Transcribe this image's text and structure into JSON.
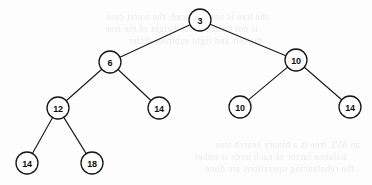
{
  "figure": {
    "kind": "binary-tree-diagram",
    "background_color": "#fdfdfd",
    "stroke_color": "#151515",
    "node_fill_color": "#ffffff",
    "node_radius": 11,
    "width": 372,
    "height": 185
  },
  "tree": {
    "nodes": [
      {
        "id": "n0",
        "label": "3",
        "x": 200,
        "y": 20,
        "level": 0
      },
      {
        "id": "n1",
        "label": "6",
        "x": 110,
        "y": 62,
        "level": 1
      },
      {
        "id": "n2",
        "label": "10",
        "x": 296,
        "y": 60,
        "level": 1
      },
      {
        "id": "n3",
        "label": "12",
        "x": 58,
        "y": 108,
        "level": 2
      },
      {
        "id": "n4",
        "label": "14",
        "x": 159,
        "y": 108,
        "level": 2
      },
      {
        "id": "n5",
        "label": "10",
        "x": 240,
        "y": 107,
        "level": 2
      },
      {
        "id": "n6",
        "label": "14",
        "x": 350,
        "y": 107,
        "level": 2
      },
      {
        "id": "n7",
        "label": "14",
        "x": 27,
        "y": 163,
        "level": 3
      },
      {
        "id": "n8",
        "label": "18",
        "x": 92,
        "y": 163,
        "level": 3
      }
    ],
    "edges": [
      {
        "from": "n0",
        "to": "n1"
      },
      {
        "from": "n0",
        "to": "n2"
      },
      {
        "from": "n1",
        "to": "n3"
      },
      {
        "from": "n1",
        "to": "n4"
      },
      {
        "from": "n2",
        "to": "n5"
      },
      {
        "from": "n2",
        "to": "n6"
      },
      {
        "from": "n3",
        "to": "n7"
      },
      {
        "from": "n3",
        "to": "n8"
      }
    ]
  },
  "background_bleed": {
    "description": "faint mirrored show-through text from the reverse side of the scanned page",
    "lines": [
      {
        "text": "the tree is not balanced, the worst case",
        "x": 18,
        "y": 12,
        "size": 9.5
      },
      {
        "text": "is not balanced the height of the tree",
        "x": 8,
        "y": 24,
        "size": 9.5
      },
      {
        "text": "the left and right subtrees differ",
        "x": 12,
        "y": 36,
        "size": 9.5
      },
      {
        "text": "an AVL tree is a binary search tree",
        "x": 110,
        "y": 140,
        "size": 9.5
      },
      {
        "text": "balance factor of each node is either",
        "x": 96,
        "y": 152,
        "size": 9.5
      },
      {
        "text": "the rebalancing operations are done",
        "x": 104,
        "y": 164,
        "size": 9.5
      }
    ]
  }
}
